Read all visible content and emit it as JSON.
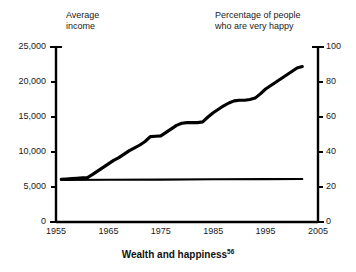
{
  "caption": {
    "text": "Wealth and happiness",
    "note": "56"
  },
  "headers": {
    "left": "Average\nincome",
    "right": "Percentage of people\nwho are very happy"
  },
  "chart_data": {
    "type": "line",
    "title": "Wealth and happiness",
    "xlabel": "",
    "ylabel": "Average income",
    "y2label": "Percentage of people who are very happy",
    "xlim": [
      1955,
      2005
    ],
    "ylim": [
      0,
      25000
    ],
    "y2lim": [
      0,
      100
    ],
    "grid": false,
    "legend": "none",
    "xticks": [
      "1955",
      "1965",
      "1975",
      "1985",
      "1995",
      "2005"
    ],
    "xtick_values": [
      1955,
      1965,
      1975,
      1985,
      1995,
      2005
    ],
    "yticks": [
      "0",
      "5,000",
      "10,000",
      "15,000",
      "20,000",
      "25,000"
    ],
    "ytick_values": [
      0,
      5000,
      10000,
      15000,
      20000,
      25000
    ],
    "y2ticks": [
      "0",
      "20",
      "40",
      "60",
      "80",
      "100"
    ],
    "y2tick_values": [
      0,
      20,
      40,
      60,
      80,
      100
    ],
    "series": [
      {
        "name": "Average income",
        "axis": "left",
        "color": "#000000",
        "x": [
          1956,
          1957,
          1958,
          1959,
          1960,
          1961,
          1962,
          1963,
          1964,
          1965,
          1966,
          1967,
          1968,
          1969,
          1970,
          1971,
          1972,
          1973,
          1974,
          1975,
          1976,
          1977,
          1978,
          1979,
          1980,
          1981,
          1982,
          1983,
          1984,
          1985,
          1986,
          1987,
          1988,
          1989,
          1990,
          1991,
          1992,
          1993,
          1994,
          1995,
          1996,
          1997,
          1998,
          1999,
          2000,
          2001,
          2002
        ],
        "values": [
          6100,
          6150,
          6200,
          6250,
          6300,
          6350,
          6800,
          7300,
          7800,
          8300,
          8800,
          9200,
          9700,
          10200,
          10600,
          11000,
          11500,
          12200,
          12250,
          12300,
          12800,
          13300,
          13800,
          14100,
          14200,
          14200,
          14200,
          14300,
          15000,
          15600,
          16100,
          16600,
          17000,
          17300,
          17400,
          17400,
          17500,
          17700,
          18300,
          19000,
          19500,
          20000,
          20500,
          21000,
          21500,
          22000,
          22200
        ]
      },
      {
        "name": "Percentage of people who are very happy",
        "axis": "right",
        "color": "#000000",
        "x": [
          1956,
          1965,
          1975,
          1985,
          1995,
          2002
        ],
        "values": [
          24.0,
          24.1,
          24.2,
          24.4,
          24.5,
          24.6
        ]
      }
    ]
  }
}
